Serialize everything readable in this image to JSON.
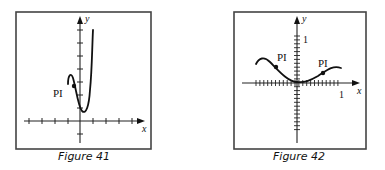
{
  "figures": [
    {
      "id": "figure-41",
      "caption": "Figure 41",
      "x_label": "x",
      "y_label": "y",
      "point_label": "PI",
      "box": {
        "left": 16,
        "top": 12,
        "right": 151,
        "bottom": 149
      },
      "origin": {
        "x": 80,
        "y": 121
      },
      "x_ticks": [
        29,
        42,
        55,
        68,
        93,
        106,
        119,
        132
      ],
      "y_ticks": [
        108,
        95,
        82,
        69,
        56,
        43,
        30,
        134
      ],
      "x_arrow": 145,
      "y_arrow": 16,
      "curve": "M68,84 C68,75 71,72 73,78 C76,88 78,106 82,111 C86,115 89,106 90,90 C92,70 92,50 93,30",
      "inflection_points": [
        {
          "x": 74,
          "y": 86,
          "label_x": 53,
          "label_y": 97
        }
      ]
    },
    {
      "id": "figure-42",
      "caption": "Figure 42",
      "x_label": "x",
      "y_label": "y",
      "point_label": "PI",
      "tick_label_one": "1",
      "box": {
        "left": 234,
        "top": 12,
        "right": 366,
        "bottom": 149
      },
      "origin": {
        "x": 297,
        "y": 83
      },
      "x_tick_start": 256,
      "x_tick_end": 341,
      "x_tick_step": 3.9,
      "y_tick_start": 36,
      "y_tick_end": 130,
      "y_tick_step": 3.9,
      "x_arrow": 360,
      "y_arrow": 16,
      "curve": "M256,64 C259,58 264,56 270,62 C278,70 288,82 297,82 C305,83 311,80 318,76 C326,71 332,65 341,68",
      "inflection_points": [
        {
          "x": 276,
          "y": 67,
          "label_x": 277,
          "label_y": 61
        },
        {
          "x": 323,
          "y": 73,
          "label_x": 318,
          "label_y": 67
        }
      ],
      "one_x_label_pos": {
        "x": 339,
        "y": 98
      },
      "one_y_label_pos": {
        "x": 303,
        "y": 43
      }
    }
  ]
}
